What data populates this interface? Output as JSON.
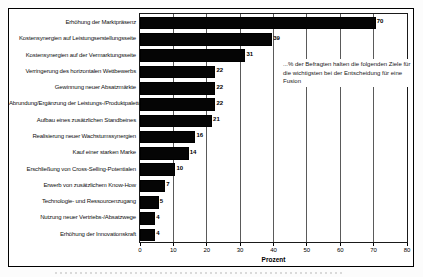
{
  "chart_data": {
    "type": "bar",
    "orientation": "horizontal",
    "title": "",
    "categories": [
      "Erhöhung der Marktpräsenz",
      "Kostensynergien auf Leistungserstellungsseite",
      "Kostensynergien auf der Vermarktungsseite",
      "Verringerung des horizontalen Wettbewerbs",
      "Gewinnung neuer Absatzmärkte",
      "Abrundung/Ergänzung der Leistungs-/Produktpalette",
      "Aufbau eines zusätzlichen Standbeines",
      "Realisierung neuer Wachstumssynergien",
      "Kauf einer starken Marke",
      "Erschließung von Cross-Selling-Potentialen",
      "Erwerb von zusätzlichem Know-How",
      "Technologie- und Ressourcenzugang",
      "Nutzung neuer Vertriebs-/Absatzwege",
      "Erhöhung der Innovationskraft"
    ],
    "values": [
      70,
      39,
      31,
      22,
      22,
      22,
      21,
      16,
      14,
      10,
      7,
      5,
      4,
      4
    ],
    "xlabel": "Prozent",
    "ylabel": "",
    "xlim": [
      0,
      80
    ],
    "xticks": [
      0,
      10,
      20,
      30,
      40,
      50,
      60,
      70,
      80
    ],
    "grid": true,
    "legend_position": "none",
    "annotation": "...% der Befragten halten die folgenden Ziele für die wichtigsten bei der Entscheidung für eine Fusion",
    "bar_color": "#050505",
    "background_color": "#ffffff",
    "frame_color": "#000000"
  }
}
